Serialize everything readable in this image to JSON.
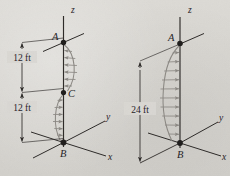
{
  "figure": {
    "background_color": "#d9d7d2",
    "ink_color": "#2b2826",
    "load_color": "#8d8a85",
    "diagrams": [
      {
        "id": "left-diagram",
        "name": "two-segment-distributed-load-diagram",
        "axes": {
          "z_label": "z",
          "y_label": "y",
          "x_label": "x"
        },
        "points": [
          {
            "id": "A",
            "label": "A"
          },
          {
            "id": "C",
            "label": "C"
          },
          {
            "id": "B",
            "label": "B"
          }
        ],
        "dimensions": [
          {
            "id": "dim-upper",
            "label": "12 ft",
            "from": "A",
            "to": "C"
          },
          {
            "id": "dim-lower",
            "label": "12 ft",
            "from": "C",
            "to": "B"
          }
        ],
        "loads": [
          {
            "id": "load-upper",
            "span": "A-C",
            "direction": "negative-y",
            "bulge": "right"
          },
          {
            "id": "load-lower",
            "span": "C-B",
            "direction": "positive-y",
            "bulge": "left"
          }
        ]
      },
      {
        "id": "right-diagram",
        "name": "single-span-distributed-load-diagram",
        "axes": {
          "z_label": "z",
          "y_label": "y",
          "x_label": "x"
        },
        "points": [
          {
            "id": "A",
            "label": "A"
          },
          {
            "id": "B",
            "label": "B"
          }
        ],
        "dimensions": [
          {
            "id": "dim-full",
            "label": "24 ft",
            "from": "A",
            "to": "B"
          }
        ],
        "loads": [
          {
            "id": "load-full",
            "span": "A-B",
            "direction": "positive-y",
            "bulge": "left"
          }
        ]
      }
    ]
  }
}
